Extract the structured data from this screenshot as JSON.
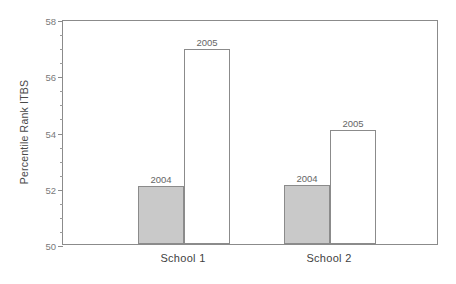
{
  "chart_data": {
    "type": "bar",
    "title": "",
    "subtitle": "",
    "xlabel": "",
    "ylabel": "Percentile Rank ITBS",
    "categories": [
      "School 1",
      "School 2"
    ],
    "series": [
      {
        "name": "2004",
        "values": [
          52.05,
          52.1
        ],
        "fill": "#c9c9c9"
      },
      {
        "name": "2005",
        "values": [
          56.95,
          54.05
        ],
        "fill": "#ffffff"
      }
    ],
    "ylim": [
      50,
      58
    ],
    "ytick_labels": [
      "50",
      "52",
      "54",
      "56",
      "58"
    ],
    "ytick_values": [
      50,
      52,
      54,
      56,
      58
    ],
    "yminor_step": 0.5,
    "grid": false,
    "legend": "none",
    "bar_value_labels": [
      {
        "category": "School 1",
        "series": "2004",
        "text": "2004"
      },
      {
        "category": "School 1",
        "series": "2005",
        "text": "2005"
      },
      {
        "category": "School 2",
        "series": "2004",
        "text": "2004"
      },
      {
        "category": "School 2",
        "series": "2005",
        "text": "2005"
      }
    ],
    "frame_color": "#8b8b8b",
    "text_color": "#555555"
  }
}
